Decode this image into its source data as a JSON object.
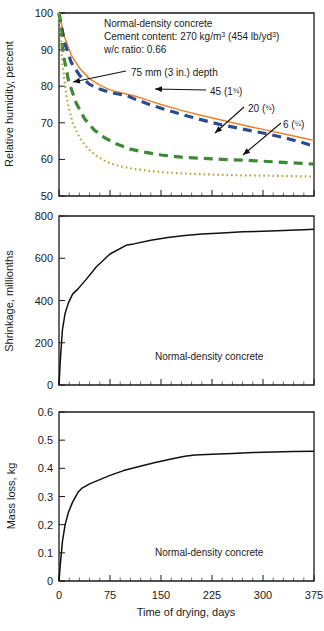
{
  "figure": {
    "name": "concrete-drying-figure",
    "background": "#ffffff"
  },
  "colors": {
    "axis": "#1a1a1a",
    "series_75mm": "#E8822A",
    "series_45mm": "#2B4B8F",
    "series_20mm": "#3E8A34",
    "series_6mm": "#B8A63A",
    "mono": "#111111"
  },
  "chart_data": [
    {
      "id": "relative-humidity",
      "type": "line",
      "title": "",
      "xlabel": "",
      "ylabel": "Relative humidity, percent",
      "xlim": [
        0,
        375
      ],
      "ylim": [
        50,
        100
      ],
      "xticks": [
        0,
        75,
        150,
        225,
        300,
        375
      ],
      "xtick_labels": [
        "",
        "",
        "",
        "",
        "",
        ""
      ],
      "yticks": [
        50,
        60,
        70,
        80,
        90,
        100
      ],
      "ytick_labels": [
        "50",
        "60",
        "70",
        "80",
        "90",
        "100"
      ],
      "minor_xtick_step": 15,
      "grid": false,
      "legend": "inline-annotations",
      "box_text": [
        "Normal-density concrete",
        "Cement content: 270 kg/m3  (454 lb/yd3)",
        "w/c ratio: 0.66"
      ],
      "box_text_rich": [
        {
          "pre": "Normal-density concrete",
          "sup": "",
          "post": ""
        },
        {
          "pre": "Cement content: 270 kg/m",
          "sup": "3",
          "post": "  (454 lb/yd",
          "sup2": "3",
          "post2": ")"
        },
        {
          "pre": "w/c ratio: 0.66",
          "sup": "",
          "post": ""
        }
      ],
      "series": [
        {
          "name": "75 mm (3 in.) depth",
          "label": "75 mm (3 in.) depth",
          "color": "#E8822A",
          "style": "solid",
          "x": [
            0,
            8,
            18,
            30,
            45,
            60,
            75,
            100,
            110,
            130,
            150,
            180,
            210,
            240,
            270,
            300,
            330,
            360,
            375
          ],
          "y": [
            100,
            93.5,
            88.5,
            85,
            82,
            80.3,
            79,
            77.8,
            77.4,
            76.2,
            75.0,
            73.4,
            72.0,
            70.7,
            69.4,
            68.2,
            67.0,
            65.8,
            65.2
          ]
        },
        {
          "name": "45 (1 3/4)",
          "label": "45 (1¾)",
          "color": "#2B4B8F",
          "style": "dashed",
          "x": [
            0,
            8,
            18,
            30,
            45,
            60,
            75,
            100,
            110,
            130,
            150,
            180,
            210,
            240,
            270,
            300,
            330,
            360,
            375
          ],
          "y": [
            100,
            92.0,
            86.5,
            83.0,
            80.5,
            79.2,
            78.3,
            77.4,
            76.6,
            75.2,
            74.0,
            72.3,
            70.8,
            69.4,
            68.3,
            67.2,
            66.0,
            64.5,
            63.6
          ]
        },
        {
          "name": "20 (3/4)",
          "label": "20 (¾)",
          "color": "#3E8A34",
          "style": "dashed",
          "x": [
            0,
            6,
            14,
            25,
            38,
            52,
            68,
            85,
            105,
            125,
            150,
            180,
            210,
            240,
            270,
            300,
            330,
            360,
            375
          ],
          "y": [
            100,
            89.0,
            81.5,
            75.5,
            71.0,
            68.0,
            65.8,
            64.2,
            62.8,
            62.0,
            61.2,
            60.6,
            60.3,
            60.0,
            59.8,
            59.5,
            59.2,
            58.9,
            58.7
          ]
        },
        {
          "name": "6 (1/4)",
          "label": "6 (¼)",
          "color": "#B8A63A",
          "style": "dotted",
          "x": [
            0,
            5,
            12,
            20,
            30,
            42,
            55,
            70,
            88,
            110,
            135,
            160,
            190,
            220,
            250,
            285,
            320,
            350,
            375
          ],
          "y": [
            100,
            86.0,
            76.0,
            70.0,
            66.0,
            63.0,
            61.0,
            59.3,
            58.2,
            57.4,
            56.8,
            56.4,
            56.1,
            55.9,
            55.7,
            55.6,
            55.5,
            55.4,
            55.3
          ]
        }
      ],
      "annotations": [
        {
          "text": "75 mm (3 in.) depth",
          "label_x": 130,
          "label_y": 76,
          "target_x": 73,
          "target_y": 82
        },
        {
          "text": "45 (1¾)",
          "label_x": 210,
          "label_y": 95,
          "target_x": 155,
          "target_y": 89
        },
        {
          "text": "20 (¾)",
          "label_x": 248,
          "label_y": 112,
          "target_x": 215,
          "target_y": 133
        },
        {
          "text": "6 (¼)",
          "label_x": 285,
          "label_y": 128,
          "target_x": 243,
          "target_y": 155
        }
      ]
    },
    {
      "id": "shrinkage",
      "type": "line",
      "title": "",
      "xlabel": "",
      "ylabel": "Shrinkage, millionths",
      "xlim": [
        0,
        375
      ],
      "ylim": [
        0,
        800
      ],
      "xticks": [
        0,
        75,
        150,
        225,
        300,
        375
      ],
      "xtick_labels": [
        "",
        "",
        "",
        "",
        "",
        ""
      ],
      "yticks": [
        0,
        200,
        400,
        600,
        800
      ],
      "ytick_labels": [
        "0",
        "200",
        "400",
        "600",
        "800"
      ],
      "minor_xtick_step": 15,
      "grid": false,
      "inline_label": "Normal-density concrete",
      "series": [
        {
          "name": "Normal-density concrete",
          "label": "Normal-density concrete",
          "color": "#111111",
          "style": "solid",
          "x": [
            0,
            2,
            5,
            9,
            14,
            20,
            28,
            40,
            55,
            75,
            100,
            110,
            135,
            160,
            185,
            210,
            240,
            270,
            300,
            330,
            360,
            375
          ],
          "y": [
            0,
            120,
            260,
            340,
            390,
            430,
            455,
            500,
            560,
            620,
            663,
            668,
            685,
            698,
            708,
            715,
            720,
            725,
            728,
            731,
            735,
            737
          ]
        }
      ]
    },
    {
      "id": "mass-loss",
      "type": "line",
      "title": "",
      "xlabel": "Time of drying, days",
      "ylabel": "Mass loss, kg",
      "xlim": [
        0,
        375
      ],
      "ylim": [
        0,
        0.6
      ],
      "xticks": [
        0,
        75,
        150,
        225,
        300,
        375
      ],
      "xtick_labels": [
        "0",
        "75",
        "150",
        "225",
        "300",
        "375"
      ],
      "yticks": [
        0,
        0.1,
        0.2,
        0.3,
        0.4,
        0.5,
        0.6
      ],
      "ytick_labels": [
        "0",
        "0.1",
        "0.2",
        "0.3",
        "0.4",
        "0.5",
        "0.6"
      ],
      "minor_xtick_step": 15,
      "grid": false,
      "inline_label": "Normal-density concrete",
      "series": [
        {
          "name": "Normal-density concrete",
          "label": "Normal-density concrete",
          "color": "#111111",
          "style": "solid",
          "x": [
            0,
            2,
            5,
            9,
            14,
            20,
            28,
            34,
            45,
            60,
            75,
            95,
            115,
            140,
            165,
            185,
            200,
            225,
            255,
            285,
            315,
            345,
            375
          ],
          "y": [
            0,
            0.06,
            0.14,
            0.2,
            0.245,
            0.28,
            0.315,
            0.33,
            0.345,
            0.36,
            0.375,
            0.392,
            0.405,
            0.42,
            0.433,
            0.443,
            0.447,
            0.45,
            0.453,
            0.456,
            0.458,
            0.46,
            0.461
          ]
        }
      ]
    }
  ],
  "panels": {
    "humidity": {
      "ylabel": "Relative humidity, percent",
      "info_line1": "Normal-density concrete",
      "info_line2_a": "Cement content: 270 kg/m",
      "info_line2_sup1": "3",
      "info_line2_b": "  (454 lb/yd",
      "info_line2_sup2": "3",
      "info_line2_c": ")",
      "info_line3": "w/c ratio: 0.66",
      "label_75": "75 mm (3 in.) depth",
      "label_45_main": "45 (1",
      "label_45_frac": "¾",
      "label_45_end": ")",
      "label_20_main": "20 (",
      "label_20_frac": "¾",
      "label_20_end": ")",
      "label_6_main": "6 (",
      "label_6_frac": "¼",
      "label_6_end": ")",
      "ytick_100": "100",
      "ytick_90": "90",
      "ytick_80": "80",
      "ytick_70": "70",
      "ytick_60": "60",
      "ytick_50": "50"
    },
    "shrinkage": {
      "ylabel": "Shrinkage, millionths",
      "inline_label": "Normal-density concrete",
      "ytick_800": "800",
      "ytick_600": "600",
      "ytick_400": "400",
      "ytick_200": "200",
      "ytick_0": "0"
    },
    "massloss": {
      "ylabel": "Mass loss, kg",
      "inline_label": "Normal-density concrete",
      "xlabel": "Time of drying, days",
      "ytick_06": "0.6",
      "ytick_05": "0.5",
      "ytick_04": "0.4",
      "ytick_03": "0.3",
      "ytick_02": "0.2",
      "ytick_01": "0.1",
      "ytick_00": "0",
      "xtick_0": "0",
      "xtick_75": "75",
      "xtick_150": "150",
      "xtick_225": "225",
      "xtick_300": "300",
      "xtick_375": "375"
    }
  }
}
